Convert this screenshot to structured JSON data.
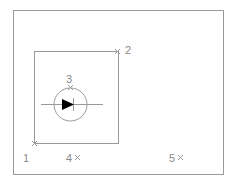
{
  "diagram": {
    "colors": {
      "line": "#9a9a9a",
      "text": "#8a8a8a",
      "symbol": "#000000",
      "background": "#ffffff"
    },
    "points": [
      {
        "id": "1",
        "label": "1",
        "marker": false
      },
      {
        "id": "2",
        "label": "2",
        "marker": true
      },
      {
        "id": "3",
        "label": "3",
        "marker": true
      },
      {
        "id": "4",
        "label": "4",
        "marker": true
      },
      {
        "id": "5",
        "label": "5",
        "marker": true
      }
    ],
    "symbol": "pump-circle-with-arrow"
  }
}
